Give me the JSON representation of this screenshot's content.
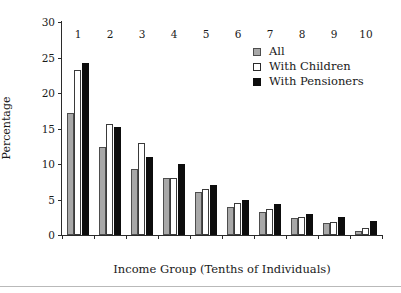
{
  "chart_data": {
    "type": "bar",
    "title": "",
    "subtitle": "",
    "xlabel": "Income Group (Tenths of Individuals)",
    "ylabel": "Percentage",
    "categories": [
      "1",
      "2",
      "3",
      "4",
      "5",
      "6",
      "7",
      "8",
      "9",
      "10"
    ],
    "series": [
      {
        "name": "All",
        "color": "#a8a8a8",
        "values": [
          17.2,
          12.4,
          9.3,
          8.1,
          6.0,
          4.0,
          3.2,
          2.4,
          1.7,
          0.6
        ]
      },
      {
        "name": "With Children",
        "color": "#ffffff",
        "values": [
          23.2,
          15.6,
          13.0,
          8.1,
          6.5,
          4.5,
          3.7,
          2.6,
          1.9,
          1.0
        ]
      },
      {
        "name": "With Pensioners",
        "color": "#0d0d0d",
        "values": [
          24.2,
          15.2,
          11.0,
          10.0,
          7.0,
          4.9,
          4.3,
          3.0,
          2.5,
          2.0
        ]
      }
    ],
    "ylim": [
      0,
      30
    ],
    "yticks": [
      0,
      5,
      10,
      15,
      20,
      25,
      30
    ],
    "ytick_labels": [
      "0",
      "5",
      "10",
      "15",
      "20",
      "25",
      "30"
    ],
    "grid": false,
    "legend_position": "top-right",
    "legend_entries": [
      "All",
      "With Children",
      "With Pensioners"
    ],
    "annotations": []
  },
  "axes": {
    "y_title": "Percentage",
    "x_title": "Income Group (Tenths of Individuals)"
  },
  "colors": {
    "all": "#a8a8a8",
    "with_children": "#ffffff",
    "with_pensioners": "#0d0d0d",
    "axis": "#2b2b2b",
    "text": "#1a1a1a",
    "background": "#ffffff"
  }
}
